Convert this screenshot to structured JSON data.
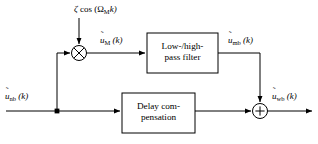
{
  "figure": {
    "type": "block-diagram",
    "background_color": "#ffffff",
    "line_color": "#000000"
  },
  "signals": {
    "modulator": {
      "text": "ζ cos (Ωₘk)",
      "zeta": "ζ",
      "cos": "cos (",
      "omega": "Ω",
      "omega_sub": "M",
      "k_close": "k)"
    },
    "input": {
      "accent": "˜",
      "base": "u",
      "sub": "nb",
      "arg": " (k)"
    },
    "modulated": {
      "accent": "˜",
      "base": "u",
      "sub": "M",
      "arg": " (k)"
    },
    "filtered": {
      "accent": "˜",
      "base": "u",
      "sub": "mb",
      "arg": " (k)"
    },
    "output": {
      "accent": "˜",
      "base": "u",
      "sub": "wb",
      "arg": " (k)"
    }
  },
  "blocks": {
    "filter": {
      "line1": "Low-/high-",
      "line2": "pass filter"
    },
    "delay": {
      "line1": "Delay com-",
      "line2": "pensation"
    }
  },
  "operators": {
    "multiplier": {
      "symbol": "⊗",
      "name": "multiplier"
    },
    "adder": {
      "symbol": "+",
      "name": "summing-junction"
    }
  }
}
